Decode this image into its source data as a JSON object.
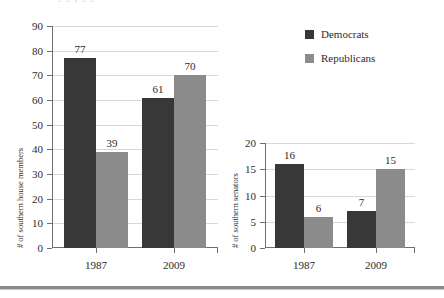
{
  "figure": {
    "clipped_text_above": "y   y       p       y  y",
    "colors": {
      "democrats": "#383838",
      "republicans": "#8b8b8b",
      "axis": "#6f6f6f",
      "gridline": "#d8d8d8",
      "text": "#2b2b2b"
    }
  },
  "legend": {
    "entries": [
      {
        "label": "Democrats",
        "color": "#383838",
        "key": "dem"
      },
      {
        "label": "Republicans",
        "color": "#8b8b8b",
        "key": "rep"
      }
    ]
  },
  "chart_data": [
    {
      "id": "house",
      "type": "bar",
      "title": "",
      "xlabel": "",
      "ylabel": "# of southern house members",
      "categories": [
        "1987",
        "2009"
      ],
      "ylim": [
        0,
        90
      ],
      "yticks": [
        0,
        10,
        20,
        30,
        40,
        50,
        60,
        70,
        80,
        90
      ],
      "ytick_labels": [
        "0",
        "10",
        "20",
        "30",
        "40",
        "50",
        "60",
        "70",
        "80",
        "90"
      ],
      "grid": true,
      "legend_position": "upper-right-outside",
      "series": [
        {
          "name": "Democrats",
          "color": "#383838",
          "values": [
            77,
            61
          ],
          "labels": [
            "77",
            "61"
          ]
        },
        {
          "name": "Republicans",
          "color": "#8b8b8b",
          "values": [
            39,
            70
          ],
          "labels": [
            "39",
            "70"
          ]
        }
      ]
    },
    {
      "id": "senate",
      "type": "bar",
      "title": "",
      "xlabel": "",
      "ylabel": "# of southern senators",
      "categories": [
        "1987",
        "2009"
      ],
      "ylim": [
        0,
        20
      ],
      "yticks": [
        0,
        5,
        10,
        15,
        20
      ],
      "ytick_labels": [
        "0",
        "5",
        "10",
        "15",
        "20"
      ],
      "grid": true,
      "legend_position": "none",
      "series": [
        {
          "name": "Democrats",
          "color": "#383838",
          "values": [
            16,
            7
          ],
          "labels": [
            "16",
            "7"
          ]
        },
        {
          "name": "Republicans",
          "color": "#8b8b8b",
          "values": [
            6,
            15
          ],
          "labels": [
            "6",
            "15"
          ]
        }
      ]
    }
  ]
}
